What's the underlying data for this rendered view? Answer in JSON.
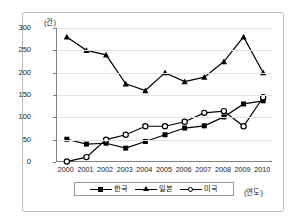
{
  "chart_data": {
    "type": "line",
    "title": "",
    "xlabel": "(연도)",
    "ylabel": "(건)",
    "ylim": [
      0,
      300
    ],
    "ytick_values": [
      0,
      50,
      100,
      150,
      200,
      250,
      300
    ],
    "ytick_labels": [
      "0",
      "50",
      "100",
      "150",
      "200",
      "250",
      "300"
    ],
    "categories": [
      "2000",
      "2001",
      "2002",
      "2003",
      "2004",
      "2005",
      "2006",
      "2007",
      "2008",
      "2009",
      "2010"
    ],
    "grid": "horizontal",
    "legend_position": "bottom",
    "series": [
      {
        "name": "한국",
        "marker": "filled-square",
        "color": "#000000",
        "values": [
          51,
          40,
          42,
          31,
          46,
          61,
          76,
          81,
          101,
          130,
          137
        ]
      },
      {
        "name": "일본",
        "marker": "filled-triangle",
        "color": "#000000",
        "values": [
          280,
          250,
          240,
          175,
          160,
          200,
          180,
          190,
          225,
          280,
          200
        ]
      },
      {
        "name": "미국",
        "marker": "open-circle",
        "color": "#000000",
        "values": [
          1,
          11,
          50,
          61,
          80,
          80,
          90,
          110,
          114,
          80,
          145
        ]
      }
    ]
  }
}
